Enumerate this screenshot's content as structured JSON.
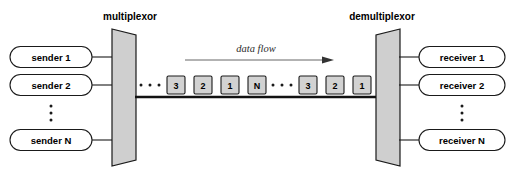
{
  "diagram": {
    "flow_label": "data flow",
    "ellipsis_glyph": "·",
    "colors": {
      "background": "#ffffff",
      "node_fill": "#ffffff",
      "node_stroke": "#1a1a1a",
      "mux_fill": "#cfcfcf",
      "packet_fill": "#d2d2d2",
      "bus_line": "#111111",
      "arrow": "#555555",
      "text": "#000000"
    }
  },
  "left": {
    "mux_label": "multiplexor",
    "senders": [
      {
        "label": "sender 1"
      },
      {
        "label": "sender 2"
      },
      {
        "label": "sender N"
      }
    ],
    "vertical_ellipsis_dots": 3
  },
  "right": {
    "demux_label": "demultiplexor",
    "receivers": [
      {
        "label": "receiver 1"
      },
      {
        "label": "receiver 2"
      },
      {
        "label": "receiver N"
      }
    ],
    "vertical_ellipsis_dots": 3
  },
  "bus": {
    "direction": "left-to-right",
    "stream": [
      {
        "type": "ellipsis",
        "dots": 3
      },
      {
        "type": "packet",
        "label": "3"
      },
      {
        "type": "packet",
        "label": "2"
      },
      {
        "type": "packet",
        "label": "1"
      },
      {
        "type": "packet",
        "label": "N"
      },
      {
        "type": "ellipsis",
        "dots": 3
      },
      {
        "type": "packet",
        "label": "3"
      },
      {
        "type": "packet",
        "label": "2"
      },
      {
        "type": "packet",
        "label": "1"
      }
    ]
  }
}
